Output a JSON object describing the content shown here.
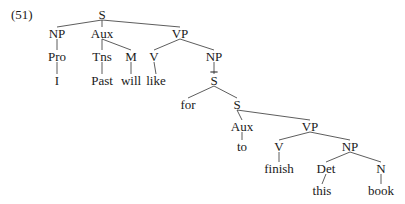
{
  "example_number": "(51)",
  "nodes": [
    {
      "id": "s1",
      "label": "S",
      "x": 102,
      "y": 14
    },
    {
      "id": "np1",
      "label": "NP",
      "x": 57,
      "y": 33
    },
    {
      "id": "aux1",
      "label": "Aux",
      "x": 102,
      "y": 33
    },
    {
      "id": "vp1",
      "label": "VP",
      "x": 180,
      "y": 33
    },
    {
      "id": "pro",
      "label": "Pro",
      "x": 57,
      "y": 56
    },
    {
      "id": "tns",
      "label": "Tns",
      "x": 102,
      "y": 56
    },
    {
      "id": "m",
      "label": "M",
      "x": 131,
      "y": 56
    },
    {
      "id": "v1",
      "label": "V",
      "x": 154,
      "y": 56
    },
    {
      "id": "np2",
      "label": "NP",
      "x": 214,
      "y": 56
    },
    {
      "id": "w_i",
      "label": "I",
      "x": 57,
      "y": 80
    },
    {
      "id": "w_past",
      "label": "Past",
      "x": 102,
      "y": 80
    },
    {
      "id": "w_will",
      "label": "will",
      "x": 131,
      "y": 80
    },
    {
      "id": "w_like",
      "label": "like",
      "x": 156,
      "y": 80
    },
    {
      "id": "sbar",
      "label": "S",
      "bar": true,
      "x": 214,
      "y": 80
    },
    {
      "id": "w_for",
      "label": "for",
      "x": 188,
      "y": 104
    },
    {
      "id": "s2",
      "label": "S",
      "x": 237,
      "y": 104
    },
    {
      "id": "aux2",
      "label": "Aux",
      "x": 242,
      "y": 126
    },
    {
      "id": "vp2",
      "label": "VP",
      "x": 310,
      "y": 126
    },
    {
      "id": "w_to",
      "label": "to",
      "x": 242,
      "y": 146
    },
    {
      "id": "v2",
      "label": "V",
      "x": 279,
      "y": 146
    },
    {
      "id": "np3",
      "label": "NP",
      "x": 350,
      "y": 146
    },
    {
      "id": "w_finish",
      "label": "finish",
      "x": 279,
      "y": 168
    },
    {
      "id": "det",
      "label": "Det",
      "x": 326,
      "y": 168
    },
    {
      "id": "n",
      "label": "N",
      "x": 381,
      "y": 168
    },
    {
      "id": "w_this",
      "label": "this",
      "x": 322,
      "y": 190
    },
    {
      "id": "w_book",
      "label": "book",
      "x": 381,
      "y": 190
    }
  ],
  "edges": [
    [
      "s1",
      "np1"
    ],
    [
      "s1",
      "aux1"
    ],
    [
      "s1",
      "vp1"
    ],
    [
      "np1",
      "pro"
    ],
    [
      "pro",
      "w_i"
    ],
    [
      "aux1",
      "tns"
    ],
    [
      "aux1",
      "m"
    ],
    [
      "tns",
      "w_past"
    ],
    [
      "m",
      "w_will"
    ],
    [
      "vp1",
      "v1"
    ],
    [
      "vp1",
      "np2"
    ],
    [
      "v1",
      "w_like"
    ],
    [
      "np2",
      "sbar"
    ],
    [
      "sbar",
      "w_for"
    ],
    [
      "sbar",
      "s2"
    ],
    [
      "s2",
      "aux2"
    ],
    [
      "s2",
      "vp2"
    ],
    [
      "aux2",
      "w_to"
    ],
    [
      "vp2",
      "v2"
    ],
    [
      "vp2",
      "np3"
    ],
    [
      "v2",
      "w_finish"
    ],
    [
      "np3",
      "det"
    ],
    [
      "np3",
      "n"
    ],
    [
      "det",
      "w_this"
    ],
    [
      "n",
      "w_book"
    ]
  ]
}
